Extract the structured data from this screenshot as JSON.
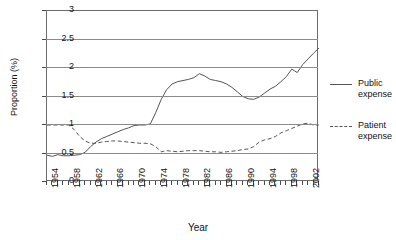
{
  "chart_data": {
    "type": "line",
    "title": "",
    "xlabel": "Year",
    "ylabel": "Proportion (%)",
    "xlim": [
      1954,
      2004
    ],
    "ylim": [
      0,
      3
    ],
    "yticks": [
      "0",
      "0.5",
      "1",
      "1.5",
      "2",
      "2.5",
      "3"
    ],
    "xticks": [
      "1954",
      "1958",
      "1962",
      "1966",
      "1970",
      "1974",
      "1978",
      "1982",
      "1986",
      "1990",
      "1994",
      "1998",
      "2002"
    ],
    "grid": "horizontal",
    "legend_position": "right",
    "x": [
      1954,
      1955,
      1956,
      1957,
      1958,
      1959,
      1960,
      1961,
      1962,
      1963,
      1964,
      1965,
      1966,
      1967,
      1968,
      1969,
      1970,
      1971,
      1972,
      1973,
      1974,
      1975,
      1976,
      1977,
      1978,
      1979,
      1980,
      1981,
      1982,
      1983,
      1984,
      1985,
      1986,
      1987,
      1988,
      1989,
      1990,
      1991,
      1992,
      1993,
      1994,
      1995,
      1996,
      1997,
      1998,
      1999,
      2000,
      2001,
      2002,
      2003,
      2004
    ],
    "series": [
      {
        "name": "Public expense",
        "style": "solid",
        "color": "#555555",
        "values": [
          0.47,
          0.45,
          0.48,
          0.46,
          0.46,
          0.47,
          0.48,
          0.52,
          0.62,
          0.7,
          0.76,
          0.8,
          0.84,
          0.88,
          0.92,
          0.95,
          0.99,
          1.0,
          1.0,
          1.02,
          1.22,
          1.45,
          1.62,
          1.72,
          1.76,
          1.78,
          1.8,
          1.83,
          1.9,
          1.86,
          1.8,
          1.78,
          1.76,
          1.72,
          1.66,
          1.58,
          1.5,
          1.46,
          1.45,
          1.49,
          1.56,
          1.63,
          1.68,
          1.76,
          1.85,
          1.98,
          1.92,
          2.06,
          2.16,
          2.26,
          2.35
        ]
      },
      {
        "name": "Patient expense",
        "style": "dashed",
        "color": "#555555",
        "values": [
          1.0,
          1.0,
          1.0,
          1.0,
          1.0,
          0.92,
          0.8,
          0.72,
          0.68,
          0.68,
          0.7,
          0.71,
          0.72,
          0.72,
          0.71,
          0.7,
          0.69,
          0.68,
          0.68,
          0.67,
          0.62,
          0.53,
          0.55,
          0.54,
          0.53,
          0.54,
          0.55,
          0.55,
          0.55,
          0.54,
          0.53,
          0.53,
          0.52,
          0.53,
          0.54,
          0.55,
          0.57,
          0.58,
          0.62,
          0.7,
          0.74,
          0.76,
          0.8,
          0.86,
          0.9,
          0.94,
          0.98,
          1.02,
          1.03,
          1.0,
          1.0
        ]
      }
    ],
    "legend": [
      {
        "label_line1": "Public",
        "label_line2": "expense",
        "style": "solid"
      },
      {
        "label_line1": "Patient",
        "label_line2": "expense",
        "style": "dashed"
      }
    ]
  }
}
